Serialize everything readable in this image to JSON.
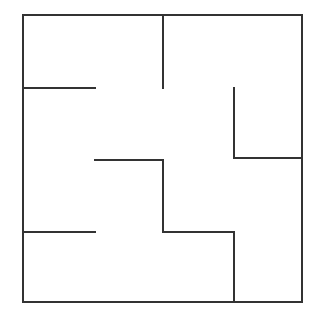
{
  "maze": {
    "stroke_color": "#333333",
    "background": "#ffffff",
    "outer_box": {
      "x1": 23,
      "y1": 15,
      "x2": 302,
      "y2": 302
    },
    "walls": [
      {
        "id": "top-center-vertical",
        "x1": 163,
        "y1": 15,
        "x2": 163,
        "y2": 88
      },
      {
        "id": "left-upper-horizontal",
        "x1": 23,
        "y1": 88,
        "x2": 95,
        "y2": 88
      },
      {
        "id": "right-upper-vertical",
        "x1": 234,
        "y1": 88,
        "x2": 234,
        "y2": 158
      },
      {
        "id": "right-middle-horizontal",
        "x1": 234,
        "y1": 158,
        "x2": 302,
        "y2": 158
      },
      {
        "id": "center-horizontal",
        "x1": 95,
        "y1": 160,
        "x2": 163,
        "y2": 160
      },
      {
        "id": "center-vertical",
        "x1": 163,
        "y1": 160,
        "x2": 163,
        "y2": 232
      },
      {
        "id": "center-lower-horizontal",
        "x1": 163,
        "y1": 232,
        "x2": 234,
        "y2": 232
      },
      {
        "id": "right-lower-vertical",
        "x1": 234,
        "y1": 232,
        "x2": 234,
        "y2": 302
      },
      {
        "id": "left-lower-horizontal",
        "x1": 23,
        "y1": 232,
        "x2": 95,
        "y2": 232
      }
    ]
  }
}
